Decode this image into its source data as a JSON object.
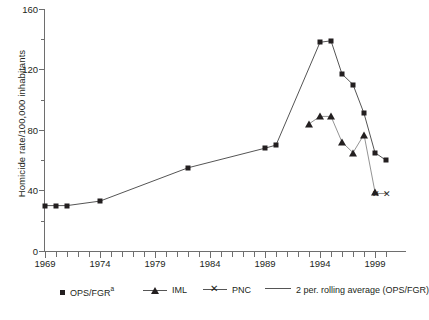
{
  "chart_data": {
    "type": "line",
    "title": "",
    "xlabel": "",
    "ylabel": "Homicide rate/100,000 inhabitants",
    "xlim": [
      1969,
      2000
    ],
    "ylim": [
      0,
      160
    ],
    "yticks": [
      0,
      40,
      80,
      120,
      160
    ],
    "xticks": [
      1969,
      1974,
      1979,
      1984,
      1989,
      1994,
      1999
    ],
    "xtick_labels": [
      "1969",
      "1974",
      "1979",
      "1984",
      "1989",
      "1994",
      "1999"
    ],
    "ytick_labels": [
      "0",
      "40",
      "80",
      "120",
      "160"
    ],
    "grid": false,
    "legend_position": "bottom",
    "series": [
      {
        "name": "OPS/FGR",
        "marker": "square",
        "color": "#231f20",
        "points": [
          {
            "x": 1969,
            "y": 30
          },
          {
            "x": 1970,
            "y": 30
          },
          {
            "x": 1971,
            "y": 30
          },
          {
            "x": 1974,
            "y": 33
          },
          {
            "x": 1982,
            "y": 55
          },
          {
            "x": 1989,
            "y": 68
          },
          {
            "x": 1990,
            "y": 70
          },
          {
            "x": 1994,
            "y": 138
          },
          {
            "x": 1995,
            "y": 139
          },
          {
            "x": 1996,
            "y": 117
          },
          {
            "x": 1997,
            "y": 110
          },
          {
            "x": 1998,
            "y": 91
          },
          {
            "x": 1999,
            "y": 65
          },
          {
            "x": 2000,
            "y": 60
          }
        ]
      },
      {
        "name": "IML",
        "marker": "triangle",
        "color": "#231f20",
        "points": [
          {
            "x": 1993,
            "y": 84
          },
          {
            "x": 1994,
            "y": 89
          },
          {
            "x": 1995,
            "y": 89
          },
          {
            "x": 1996,
            "y": 72
          },
          {
            "x": 1997,
            "y": 65
          },
          {
            "x": 1998,
            "y": 77
          },
          {
            "x": 1999,
            "y": 39
          }
        ]
      },
      {
        "name": "PNC",
        "marker": "x",
        "color": "#231f20",
        "points": [
          {
            "x": 1999,
            "y": 38
          },
          {
            "x": 2000,
            "y": 38
          }
        ]
      },
      {
        "name": "2 per. rolling average (OPS/FGR)",
        "marker": "none",
        "color": "#555555",
        "points": []
      }
    ]
  },
  "legend": {
    "items": [
      {
        "label": "OPS/FGR",
        "superscript": "a",
        "marker": "square"
      },
      {
        "label": "IML",
        "superscript": "",
        "marker": "triangle"
      },
      {
        "label": "PNC",
        "superscript": "",
        "marker": "x"
      },
      {
        "label": "2 per. rolling average (OPS/FGR)",
        "superscript": "",
        "marker": "line"
      }
    ]
  },
  "caption": {
    "text": ""
  }
}
